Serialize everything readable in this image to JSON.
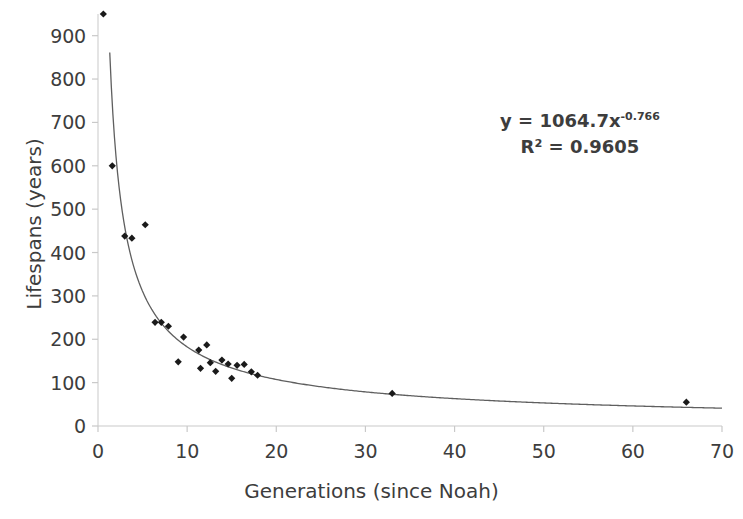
{
  "chart_data": {
    "type": "scatter",
    "title": "",
    "xlabel": "Generations (since Noah)",
    "ylabel": "Lifespans (years)",
    "xlim": [
      0,
      70
    ],
    "ylim": [
      0,
      950
    ],
    "xticks": [
      0,
      10,
      20,
      30,
      40,
      50,
      60,
      70
    ],
    "yticks": [
      0,
      100,
      200,
      300,
      400,
      500,
      600,
      700,
      800,
      900
    ],
    "grid": false,
    "legend": null,
    "series": [
      {
        "name": "Lifespans",
        "marker": "diamond",
        "color": "#1a1a1a",
        "points": [
          {
            "x": 0.6,
            "y": 950
          },
          {
            "x": 1.6,
            "y": 600
          },
          {
            "x": 3.0,
            "y": 438
          },
          {
            "x": 3.8,
            "y": 433
          },
          {
            "x": 5.3,
            "y": 464
          },
          {
            "x": 6.4,
            "y": 239
          },
          {
            "x": 7.1,
            "y": 239
          },
          {
            "x": 7.9,
            "y": 230
          },
          {
            "x": 9.0,
            "y": 148
          },
          {
            "x": 9.6,
            "y": 205
          },
          {
            "x": 11.3,
            "y": 175
          },
          {
            "x": 11.5,
            "y": 133
          },
          {
            "x": 12.2,
            "y": 187
          },
          {
            "x": 12.6,
            "y": 146
          },
          {
            "x": 13.2,
            "y": 126
          },
          {
            "x": 13.9,
            "y": 152
          },
          {
            "x": 14.6,
            "y": 143
          },
          {
            "x": 15.0,
            "y": 110
          },
          {
            "x": 15.6,
            "y": 140
          },
          {
            "x": 16.4,
            "y": 142
          },
          {
            "x": 17.2,
            "y": 125
          },
          {
            "x": 17.9,
            "y": 117
          },
          {
            "x": 33.0,
            "y": 75
          },
          {
            "x": 66.0,
            "y": 55
          }
        ]
      }
    ],
    "trendline": {
      "type": "power",
      "coefficient": 1064.7,
      "exponent": -0.766,
      "r_squared": 0.9605,
      "color": "#5f5f5f"
    },
    "annotations": {
      "equation_prefix": "y = 1064.7x",
      "equation_exponent": "-0.766",
      "r2_text": "R² = 0.9605"
    }
  },
  "axes": {
    "x_tick_labels": [
      "0",
      "10",
      "20",
      "30",
      "40",
      "50",
      "60",
      "70"
    ],
    "y_tick_labels": [
      "0",
      "100",
      "200",
      "300",
      "400",
      "500",
      "600",
      "700",
      "800",
      "900"
    ],
    "x_title": "Generations (since Noah)",
    "y_title": "Lifespans (years)"
  },
  "colors": {
    "background": "#ffffff",
    "text": "#3d3d3d",
    "marker": "#1a1a1a",
    "trendline": "#5f5f5f",
    "axis": "#c9c9c9"
  }
}
